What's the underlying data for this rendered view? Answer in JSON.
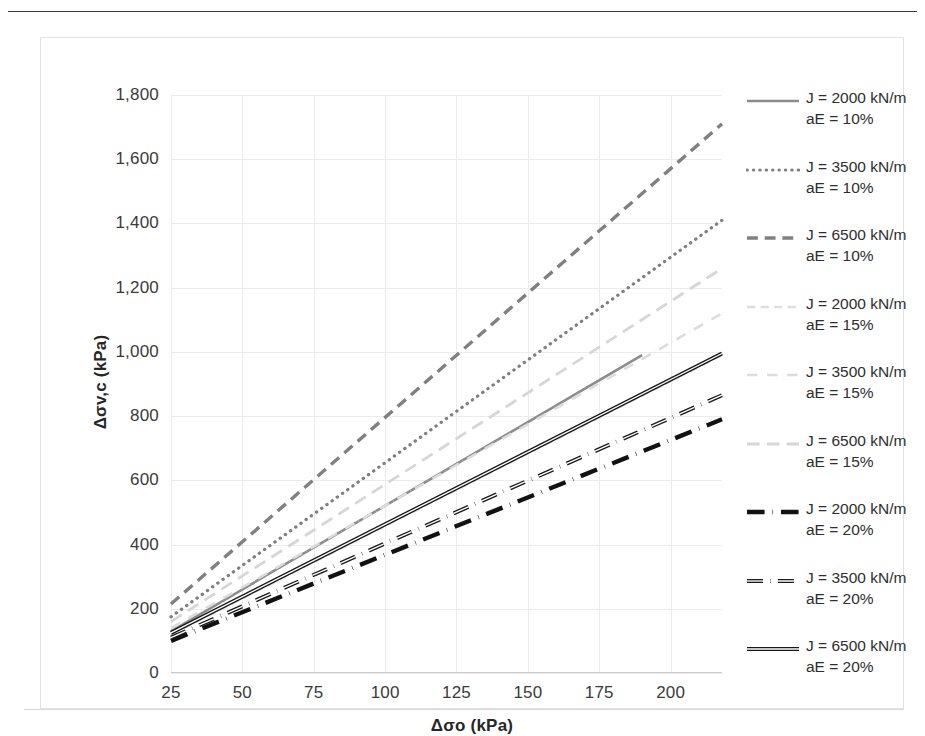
{
  "chart_data": {
    "type": "line",
    "title": "",
    "xlabel": "Δσo (kPa)",
    "ylabel": "Δσv,c (kPa)",
    "xlim": [
      25,
      218
    ],
    "ylim": [
      0,
      1800
    ],
    "xticks": [
      25,
      50,
      75,
      100,
      125,
      150,
      175,
      200
    ],
    "xticklabels": [
      "25",
      "50",
      "75",
      "100",
      "125",
      "150",
      "175",
      "200"
    ],
    "yticks": [
      0,
      200,
      400,
      600,
      800,
      1000,
      1200,
      1400,
      1600,
      1800
    ],
    "yticklabels": [
      "0",
      "200",
      "400",
      "600",
      "800",
      "1,000",
      "1,200",
      "1,400",
      "1,600",
      "1,800"
    ],
    "grid": true,
    "legend_position": "right",
    "series": [
      {
        "name": "J = 2000 kN/m aE = 10%",
        "label_line1": "J = 2000 kN/m",
        "label_line2": "aE = 10%",
        "style": "solid",
        "color": "#8c8c8c",
        "width": 2.6,
        "x": [
          25,
          190
        ],
        "y": [
          130,
          990
        ]
      },
      {
        "name": "J = 3500 kN/m aE = 10%",
        "label_line1": "J = 3500 kN/m",
        "label_line2": "aE = 10%",
        "style": "dotted",
        "color": "#7f7f7f",
        "width": 3.2,
        "x": [
          25,
          218
        ],
        "y": [
          175,
          1410
        ]
      },
      {
        "name": "J = 6500 kN/m aE = 10%",
        "label_line1": "J = 6500 kN/m",
        "label_line2": "aE = 10%",
        "style": "dashed",
        "color": "#808080",
        "width": 3.4,
        "x": [
          25,
          218
        ],
        "y": [
          215,
          1710
        ]
      },
      {
        "name": "J = 2000 kN/m aE = 15%",
        "label_line1": "J = 2000 kN/m",
        "label_line2": "aE = 15%",
        "style": "dashed",
        "color": "#dedede",
        "width": 2.6,
        "x": [
          25,
          218
        ],
        "y": [
          120,
          990
        ]
      },
      {
        "name": "J = 3500 kN/m aE = 15%",
        "label_line1": "J = 3500 kN/m",
        "label_line2": "aE = 15%",
        "style": "dashdot",
        "color": "#dcdcdc",
        "width": 2.6,
        "x": [
          25,
          218
        ],
        "y": [
          140,
          1120
        ]
      },
      {
        "name": "J = 6500 kN/m aE = 15%",
        "label_line1": "J = 6500 kN/m",
        "label_line2": "aE = 15%",
        "style": "longdash",
        "color": "#d6d6d6",
        "width": 2.8,
        "x": [
          25,
          218
        ],
        "y": [
          160,
          1260
        ]
      },
      {
        "name": "J = 2000 kN/m aE = 20%",
        "label_line1": "J = 2000 kN/m",
        "label_line2": "aE = 20%",
        "style": "dashdot",
        "color": "#121212",
        "width": 4.4,
        "x": [
          25,
          218
        ],
        "y": [
          100,
          790
        ]
      },
      {
        "name": "J = 3500 kN/m aE = 20%",
        "label_line1": "J = 3500 kN/m",
        "label_line2": "aE = 20%",
        "style": "dashdot-double",
        "color": "#1a1a1a",
        "width": 4.0,
        "x": [
          25,
          218
        ],
        "y": [
          110,
          865
        ]
      },
      {
        "name": "J = 6500 kN/m aE = 20%",
        "label_line1": "J = 6500 kN/m",
        "label_line2": "aE = 20%",
        "style": "solid-double",
        "color": "#161616",
        "width": 4.0,
        "x": [
          25,
          218
        ],
        "y": [
          125,
          995
        ]
      }
    ]
  },
  "axes": {
    "x_title": "Δσo (kPa)",
    "y_title": "Δσv,c (kPa)"
  },
  "legend": {
    "items": [
      {
        "line1": "J = 2000 kN/m",
        "line2": "aE = 10%"
      },
      {
        "line1": "J = 3500 kN/m",
        "line2": "aE = 10%"
      },
      {
        "line1": "J = 6500 kN/m",
        "line2": "aE = 10%"
      },
      {
        "line1": "J = 2000 kN/m",
        "line2": "aE = 15%"
      },
      {
        "line1": "J = 3500 kN/m",
        "line2": "aE = 15%"
      },
      {
        "line1": "J = 6500 kN/m",
        "line2": "aE = 15%"
      },
      {
        "line1": "J = 2000 kN/m",
        "line2": "aE = 20%"
      },
      {
        "line1": "J = 3500 kN/m",
        "line2": "aE = 20%"
      },
      {
        "line1": "J = 6500 kN/m",
        "line2": "aE = 20%"
      }
    ]
  },
  "colors": {
    "grid": "#ececec",
    "axis": "#c9c9c9",
    "text": "#2b2b2b",
    "light_series": "#dcdcdc",
    "mid_series": "#808080",
    "dark_series": "#161616"
  }
}
